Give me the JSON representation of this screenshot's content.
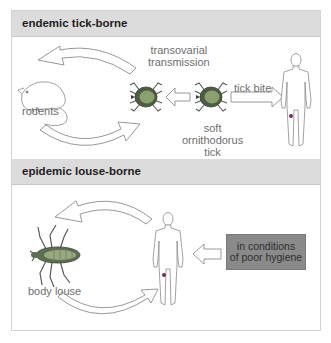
{
  "sections": [
    {
      "title": "endemic tick-borne",
      "labels": {
        "transmission": [
          "transovarial",
          "transmission"
        ],
        "rodents": "rodents",
        "tick_bite": "tick bite",
        "tick": [
          "soft",
          "ornithodorus",
          "tick"
        ]
      }
    },
    {
      "title": "epidemic louse-borne",
      "labels": {
        "louse": "body louse",
        "condition": [
          "in conditions",
          "of poor hygiene"
        ]
      }
    }
  ],
  "colors": {
    "header_bg": "#dcdcdc",
    "arrow_stroke": "#8c8c8c",
    "tick_body": "#6f8a5a",
    "condition_box": "#8a8a8a",
    "label_text": "#6e6e6e"
  }
}
